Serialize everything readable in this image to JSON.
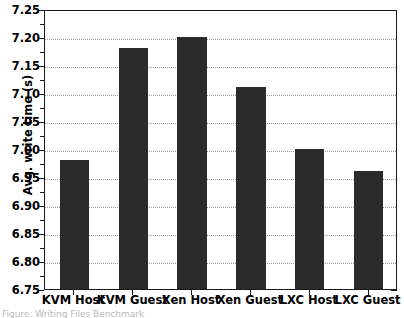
{
  "chart_data": {
    "type": "bar",
    "title": "",
    "xlabel": "",
    "ylabel": "Avg. write time (s)",
    "categories": [
      "KVM Host",
      "KVM Guest",
      "Xen Host",
      "Xen Guest",
      "LXC Host",
      "LXC Guest"
    ],
    "values": [
      6.98,
      7.18,
      7.2,
      7.11,
      7.0,
      6.96
    ],
    "ylim": [
      6.75,
      7.25
    ],
    "ytick_labels": [
      "6.75",
      "6.80",
      "6.85",
      "6.90",
      "6.95",
      "7.00",
      "7.05",
      "7.10",
      "7.15",
      "7.20",
      "7.25"
    ],
    "ytick_values": [
      6.75,
      6.8,
      6.85,
      6.9,
      6.95,
      7.0,
      7.05,
      7.1,
      7.15,
      7.2,
      7.25
    ],
    "ytick_step": 0.05,
    "minor_tick_step": 0.025,
    "grid": true,
    "grid_style": "dotted",
    "legend": null,
    "bar_color": "#2b2b2b",
    "grid_color": "#9a9a9a",
    "axis_color": "#1a1a1a",
    "background_color": "#ffffff"
  },
  "caption": {
    "clipped_text": "Figure: Writing Files Benchmark"
  }
}
